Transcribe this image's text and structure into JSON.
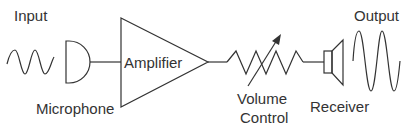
{
  "diagram": {
    "labels": {
      "input": "Input",
      "output": "Output",
      "amplifier": "Amplifier",
      "microphone": "Microphone",
      "volume_line1": "Volume",
      "volume_line2": "Control",
      "receiver": "Receiver"
    },
    "components": [
      {
        "id": "input-wave",
        "type": "sine-wave",
        "label": "Input"
      },
      {
        "id": "microphone",
        "type": "microphone-symbol",
        "label": "Microphone"
      },
      {
        "id": "amplifier",
        "type": "triangle",
        "label": "Amplifier"
      },
      {
        "id": "volume-control",
        "type": "variable-resistor",
        "label": "Volume Control"
      },
      {
        "id": "receiver",
        "type": "speaker-symbol",
        "label": "Receiver"
      },
      {
        "id": "output-wave",
        "type": "sine-wave",
        "label": "Output"
      }
    ],
    "connections": [
      [
        "microphone",
        "amplifier"
      ],
      [
        "amplifier",
        "volume-control"
      ],
      [
        "volume-control",
        "receiver"
      ]
    ],
    "colors": {
      "stroke": "#333333",
      "background": "#ffffff"
    }
  }
}
